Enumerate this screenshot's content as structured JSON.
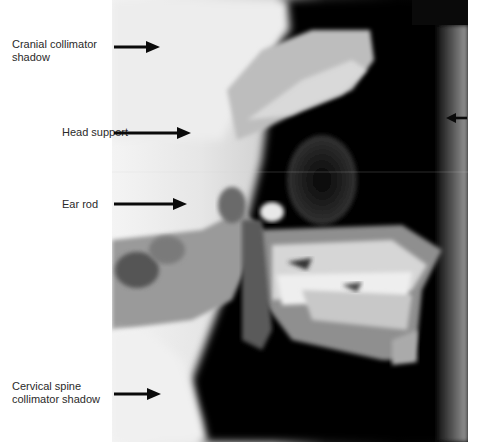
{
  "figure": {
    "type": "lateral cephalometric radiograph",
    "labels": [
      {
        "id": "cranial-collimator",
        "text": "Cranial collimator\nshadow",
        "x": 12,
        "y": 39
      },
      {
        "id": "head-support",
        "text": "Head support",
        "x": 62,
        "y": 126
      },
      {
        "id": "ear-rod",
        "text": "Ear rod",
        "x": 62,
        "y": 198
      },
      {
        "id": "cervical-spine-collimator",
        "text": "Cervical spine\ncollimator shadow",
        "x": 12,
        "y": 381
      }
    ],
    "arrows": [
      {
        "target": "cranial-collimator",
        "x1": 114,
        "y1": 47,
        "x2": 160,
        "y2": 47,
        "direction": "right"
      },
      {
        "target": "head-support",
        "x1": 114,
        "y1": 133,
        "x2": 191,
        "y2": 133,
        "direction": "right"
      },
      {
        "target": "ear-rod",
        "x1": 114,
        "y1": 204,
        "x2": 187,
        "y2": 204,
        "direction": "right"
      },
      {
        "target": "cervical-spine-collimator",
        "x1": 114,
        "y1": 394,
        "x2": 161,
        "y2": 394,
        "direction": "right"
      },
      {
        "target": "unlabeled-right",
        "x1": 467,
        "y1": 118,
        "x2": 446,
        "y2": 118,
        "direction": "left"
      }
    ],
    "colors": {
      "arrow": "#0a0a0a",
      "label_text": "#2a2a2a",
      "film_light": "#f2f2f2",
      "film_dark": "#050505"
    }
  }
}
